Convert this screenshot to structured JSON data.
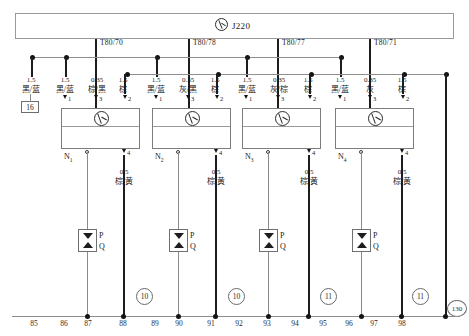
{
  "diagram": {
    "title": "J220",
    "header_symbol": "control-unit-icon"
  },
  "terminals": [
    {
      "label": "T80/70"
    },
    {
      "label": "T80/78"
    },
    {
      "label": "T80/77"
    },
    {
      "label": "T80/71"
    }
  ],
  "ground_box": {
    "label": "16"
  },
  "left_wire": {
    "gauge": "1.5",
    "color": "黑/蓝"
  },
  "modules": [
    {
      "name": "N",
      "sub": "1",
      "wires": [
        {
          "gauge": "1.5",
          "color": "黑/蓝",
          "pin": "1"
        },
        {
          "gauge": "0.35",
          "color": "棕/黑",
          "pin": "3"
        },
        {
          "gauge": "1.5",
          "color": "棕",
          "pin": "2"
        }
      ],
      "out_pin": "4",
      "out_wire": {
        "gauge": "0.5",
        "color": "棕/黄"
      }
    },
    {
      "name": "N",
      "sub": "2",
      "wires": [
        {
          "gauge": "1.5",
          "color": "黑/蓝",
          "pin": "1"
        },
        {
          "gauge": "0.35",
          "color": "灰/黑",
          "pin": "3"
        },
        {
          "gauge": "1.5",
          "color": "棕",
          "pin": "2"
        }
      ],
      "out_pin": "4",
      "out_wire": {
        "gauge": "0.5",
        "color": "棕/黄"
      }
    },
    {
      "name": "N",
      "sub": "3",
      "wires": [
        {
          "gauge": "1.5",
          "color": "黑/蓝",
          "pin": "1"
        },
        {
          "gauge": "0.35",
          "color": "灰/棕",
          "pin": "3"
        },
        {
          "gauge": "1.5",
          "color": "棕",
          "pin": "2"
        }
      ],
      "out_pin": "4",
      "out_wire": {
        "gauge": "0.5",
        "color": "棕/黄"
      }
    },
    {
      "name": "N",
      "sub": "4",
      "wires": [
        {
          "gauge": "1.5",
          "color": "黑/蓝",
          "pin": "1"
        },
        {
          "gauge": "0.35",
          "color": "灰",
          "pin": "3"
        },
        {
          "gauge": "1.5",
          "color": "棕",
          "pin": "2"
        }
      ],
      "out_pin": "4",
      "out_wire": {
        "gauge": "0.5",
        "color": "棕/黄"
      }
    }
  ],
  "valves": [
    {
      "p": "P",
      "q": "Q"
    },
    {
      "p": "P",
      "q": "Q"
    },
    {
      "p": "P",
      "q": "Q"
    },
    {
      "p": "P",
      "q": "Q"
    }
  ],
  "axis": {
    "numbers": [
      "85",
      "86",
      "87",
      "88",
      "89",
      "90",
      "91",
      "92",
      "93",
      "94",
      "95",
      "96",
      "97",
      "98"
    ],
    "circled": [
      "10",
      "10",
      "11",
      "11"
    ],
    "circled_right": "130"
  }
}
